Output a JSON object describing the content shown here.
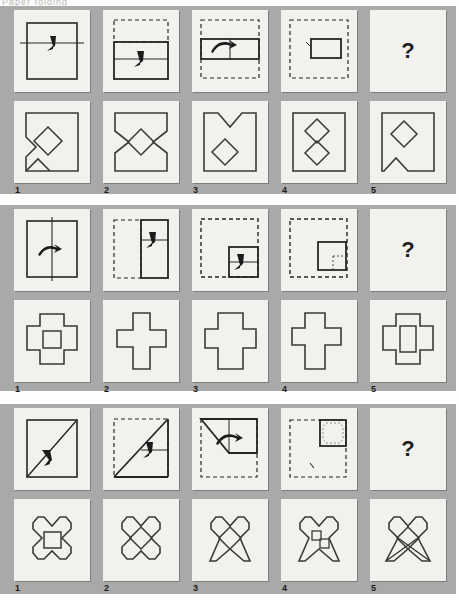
{
  "page": {
    "header_text": "Paper folding",
    "background_color": "#a9a9a9",
    "cell_color": "#f2f1ee",
    "ink_color": "#262626",
    "question_mark": "?"
  },
  "blocks": [
    {
      "id": "block-1",
      "name": "paper-folding-item-1",
      "stimulus": {
        "cells": [
          {
            "name": "fold-step-1",
            "description": "square sheet with horizontal fold line and downward fold arrow"
          },
          {
            "name": "fold-step-2",
            "description": "top band folded down, dashed outline shows original top, fold arrow"
          },
          {
            "name": "fold-step-3",
            "description": "folded to horizontal rectangle, dashed outline of original square, fold arrow"
          },
          {
            "name": "fold-step-4",
            "description": "final folded small rectangle with dashed original outline"
          },
          {
            "name": "answer-placeholder",
            "description": "question mark cell",
            "label": "?"
          }
        ]
      },
      "options": [
        {
          "number": "1",
          "name": "option-1",
          "description": "square with notched left side and offset diamond hole"
        },
        {
          "number": "2",
          "name": "option-2",
          "description": "bowtie notched square with centered diamond hole"
        },
        {
          "number": "3",
          "name": "option-3",
          "description": "square with V notch on top and diamond hole below center"
        },
        {
          "number": "4",
          "name": "option-4",
          "description": "square with two stacked diamond holes"
        },
        {
          "number": "5",
          "name": "option-5",
          "description": "square with V notch at bottom and diamond hole above"
        }
      ]
    },
    {
      "id": "block-2",
      "name": "paper-folding-item-2",
      "stimulus": {
        "cells": [
          {
            "name": "fold-step-1",
            "description": "square sheet with vertical fold line and fold arrow"
          },
          {
            "name": "fold-step-2",
            "description": "left half folded right, dashed original outline, fold arrow"
          },
          {
            "name": "fold-step-3",
            "description": "folded to smaller square at lower right, dashed original outline, fold arrow"
          },
          {
            "name": "fold-step-4",
            "description": "final folded quarter with dashed original outline and punched corner"
          },
          {
            "name": "answer-placeholder",
            "description": "question mark cell",
            "label": "?"
          }
        ]
      },
      "options": [
        {
          "number": "1",
          "name": "option-1",
          "description": "greek cross outline with square hole in centre"
        },
        {
          "number": "2",
          "name": "option-2",
          "description": "narrow greek cross outline, no hole"
        },
        {
          "number": "3",
          "name": "option-3",
          "description": "wide latin cross outline, no hole"
        },
        {
          "number": "4",
          "name": "option-4",
          "description": "latin cross outline shifted left, no hole"
        },
        {
          "number": "5",
          "name": "option-5",
          "description": "greek cross outline with tall rectangular hole in centre"
        }
      ]
    },
    {
      "id": "block-3",
      "name": "paper-folding-item-3",
      "stimulus": {
        "cells": [
          {
            "name": "fold-step-1",
            "description": "square sheet with diagonal fold line and fold arrow"
          },
          {
            "name": "fold-step-2",
            "description": "diagonal fold made, dashed original outline, fold arrow"
          },
          {
            "name": "fold-step-3",
            "description": "triangle folded into corner rectangle, dashed original outline, fold arrow"
          },
          {
            "name": "fold-step-4",
            "description": "final folded quarter square with octagonal punch, dashed original outline"
          },
          {
            "name": "answer-placeholder",
            "description": "question mark cell",
            "label": "?"
          }
        ]
      },
      "options": [
        {
          "number": "1",
          "name": "option-1",
          "description": "four-lobed clover outline with square hole in centre"
        },
        {
          "number": "2",
          "name": "option-2",
          "description": "four-lobed clover outline with diamond hole in centre"
        },
        {
          "number": "3",
          "name": "option-3",
          "description": "clover with pointed lower lobes and diamond hole"
        },
        {
          "number": "4",
          "name": "option-4",
          "description": "clover with pointed lower lobes and two small offset squares"
        },
        {
          "number": "5",
          "name": "option-5",
          "description": "crossed X clover with diamond hole in centre"
        }
      ]
    }
  ]
}
